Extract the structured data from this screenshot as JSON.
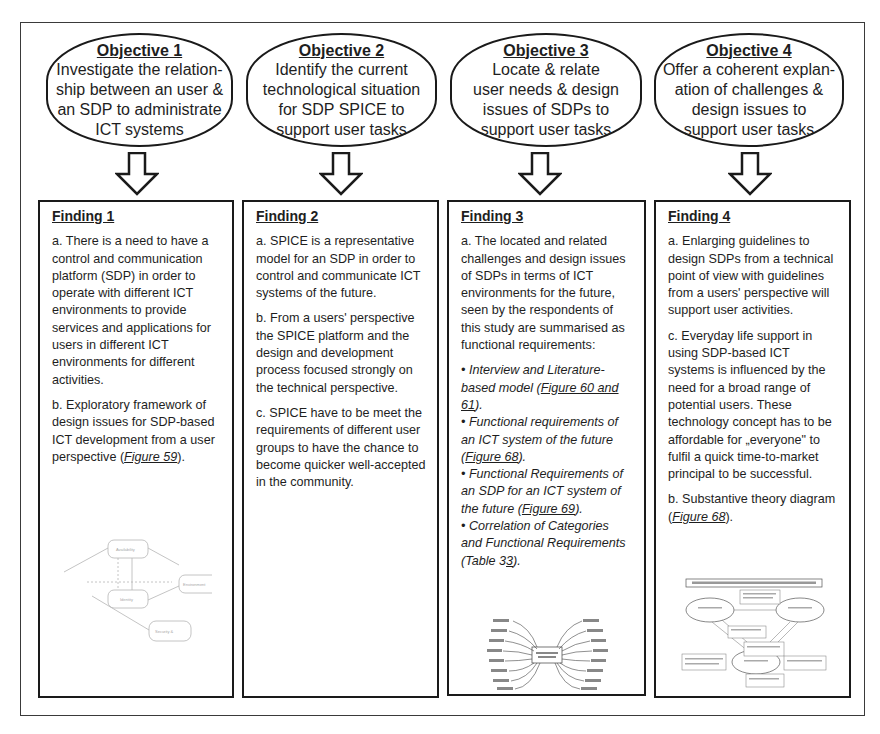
{
  "objectives": [
    {
      "title": "Objective 1",
      "text": "Investigate the relation-\nship between an user &\nan SDP to administrate\nICT systems"
    },
    {
      "title": "Objective 2",
      "text": "Identify the current\ntechnological situation\nfor SDP SPICE to\nsupport user tasks"
    },
    {
      "title": "Objective 3",
      "text": "Locate & relate\nuser needs & design\nissues of SDPs to\nsupport user tasks"
    },
    {
      "title": "Objective 4",
      "text": "Offer a coherent explan-\nation of challenges &\ndesign issues to\nsupport user tasks"
    }
  ],
  "findings": [
    {
      "title": "Finding 1",
      "a": "a. There is a need to have a control and communication platform (SDP) in order to operate with different ICT environments to provide services and applications for users in different ICT environments for different activities.",
      "b_pre": "b. Exploratory framework of design issues for SDP-based ICT development from a user perspective (",
      "b_link": "Figure 59",
      "b_post": ").",
      "thumbnail": "framework-diagram-thumbnail"
    },
    {
      "title": "Finding 2",
      "a": "a. SPICE is a representative model  for an SDP in order to control and communicate ICT systems of the future.",
      "b": "b. From a users' perspective the SPICE platform and the design and development process focused strongly on the technical perspective.",
      "c": "c. SPICE have to be meet the requirements of different user groups to have the chance to become quicker well-accepted  in the community."
    },
    {
      "title": "Finding 3",
      "a": "a. The located and related challenges and design issues of SDPs in terms of ICT environments for the future, seen by the respondents of this study are summarised as functional requirements:",
      "bullets": [
        {
          "pre": "• Interview and Literature-based model (",
          "link": "Figure 60 and 61",
          "post": ")."
        },
        {
          "pre": "• Functional  requirements of an ICT system of the future (",
          "link": "Figure 68",
          "post": ")."
        },
        {
          "pre": "• Functional Requirements of an SDP for an ICT system of the future (",
          "link": "Figure 69",
          "post": ")."
        },
        {
          "pre": "• Correlation of Categories and Functional Requirements (Table 3",
          "link": "3",
          "post": ")."
        }
      ],
      "thumbnail": "mind-map-thumbnail"
    },
    {
      "title": "Finding 4",
      "a": "a. Enlarging guidelines to design SDPs from a technical point of view with guidelines from a users' perspective will support user activities.",
      "c": "c. Everyday life support in using SDP-based ICT systems is influenced by the need for a broad range of potential users. These technology concept has to be affordable for „everyone\" to fulfil a quick time-to-market principal to be successful.",
      "b_pre": "b. Substantive theory diagram (",
      "b_link": "Figure 68",
      "b_post": ").",
      "thumbnail": "substantive-theory-thumbnail"
    }
  ],
  "icons": {
    "arrow": "down-arrow-icon"
  },
  "colors": {
    "line": "#1a1a1a",
    "text": "#1e1e1e",
    "faint": "#9a9a9a",
    "background": "#ffffff"
  }
}
